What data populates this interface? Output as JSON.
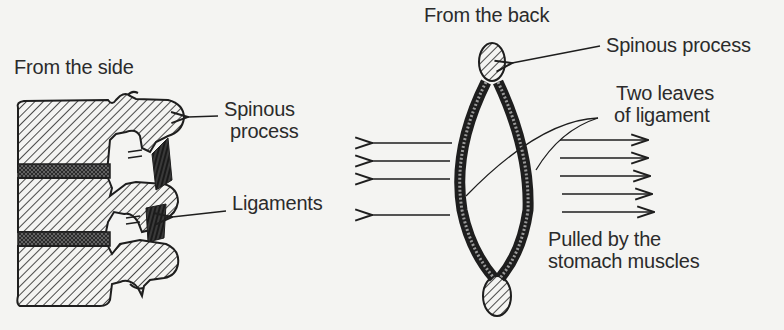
{
  "figure": {
    "side_view": {
      "heading": "From the side",
      "labels": {
        "spinous_process_line1": "Spinous",
        "spinous_process_line2": "process",
        "ligaments": "Ligaments"
      }
    },
    "back_view": {
      "heading": "From the back",
      "labels": {
        "spinous_process": "Spinous process",
        "two_leaves_line1": "Two leaves",
        "two_leaves_line2": "of ligament",
        "pulled_line1": "Pulled by the",
        "pulled_line2": "stomach muscles"
      },
      "arrows": {
        "left_count": 4,
        "right_count": 4
      }
    }
  },
  "colors": {
    "background": "#f4f4f2",
    "ink": "#1e1e1e",
    "text": "#2b2b2b"
  }
}
